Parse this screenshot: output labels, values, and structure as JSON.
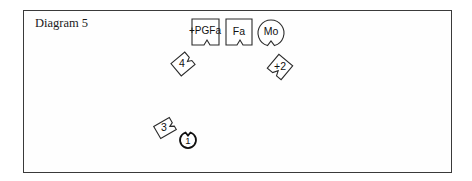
{
  "diagram": {
    "title": "Diagram 5",
    "pieces": [
      {
        "id": "pgfa",
        "label": "+PGFa",
        "shape": "notched-square"
      },
      {
        "id": "fa",
        "label": "Fa",
        "shape": "notched-square"
      },
      {
        "id": "mo",
        "label": "Mo",
        "shape": "notched-circle"
      },
      {
        "id": "four",
        "label": "4",
        "shape": "notched-tile"
      },
      {
        "id": "plus-two",
        "label": "+2",
        "shape": "notched-tile"
      },
      {
        "id": "three",
        "label": "3",
        "shape": "notched-tile"
      },
      {
        "id": "one",
        "label": "1",
        "shape": "notched-circle"
      }
    ]
  },
  "colors": {
    "stroke": "#2a2a2a",
    "text": "#111111",
    "background": "#ffffff"
  }
}
